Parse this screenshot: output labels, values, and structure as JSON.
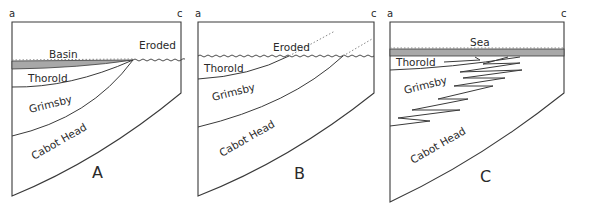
{
  "figure": {
    "panels": [
      {
        "id": "A",
        "label": "A",
        "corner_left": "a",
        "corner_right": "c",
        "units": [
          "Basin",
          "Eroded",
          "Thorold",
          "Grimsby",
          "Cabot Head"
        ]
      },
      {
        "id": "B",
        "label": "B",
        "corner_left": "a",
        "corner_right": "c",
        "units": [
          "Eroded",
          "Thorold",
          "Grimsby",
          "Cabot Head"
        ]
      },
      {
        "id": "C",
        "label": "C",
        "corner_left": "a",
        "corner_right": "c",
        "units": [
          "Sea",
          "Thorold",
          "Grimsby",
          "Cabot Head"
        ]
      }
    ]
  },
  "colors": {
    "line": "#3a3a3a",
    "shade": "#a8a8a8",
    "background": "#ffffff"
  }
}
